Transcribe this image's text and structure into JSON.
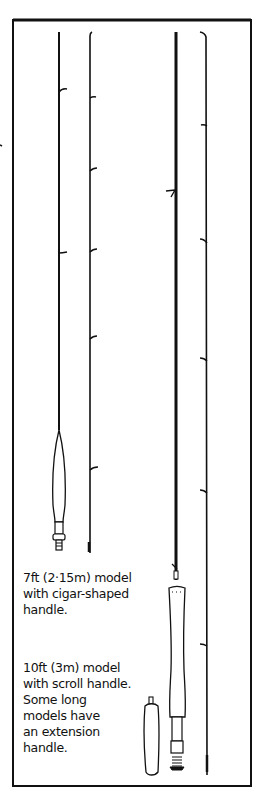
{
  "illustration": {
    "subject": "Fly fishing rods",
    "colors": {
      "ink": "#111111",
      "paper": "#ffffff"
    },
    "captions": [
      {
        "id": "seven-foot-model",
        "text": "7ft (2·15m) model\nwith cigar-shaped\nhandle."
      },
      {
        "id": "ten-foot-model",
        "text": "10ft (3m) model\nwith scroll handle.\nSome long\nmodels have\nan extension\nhandle."
      }
    ]
  }
}
